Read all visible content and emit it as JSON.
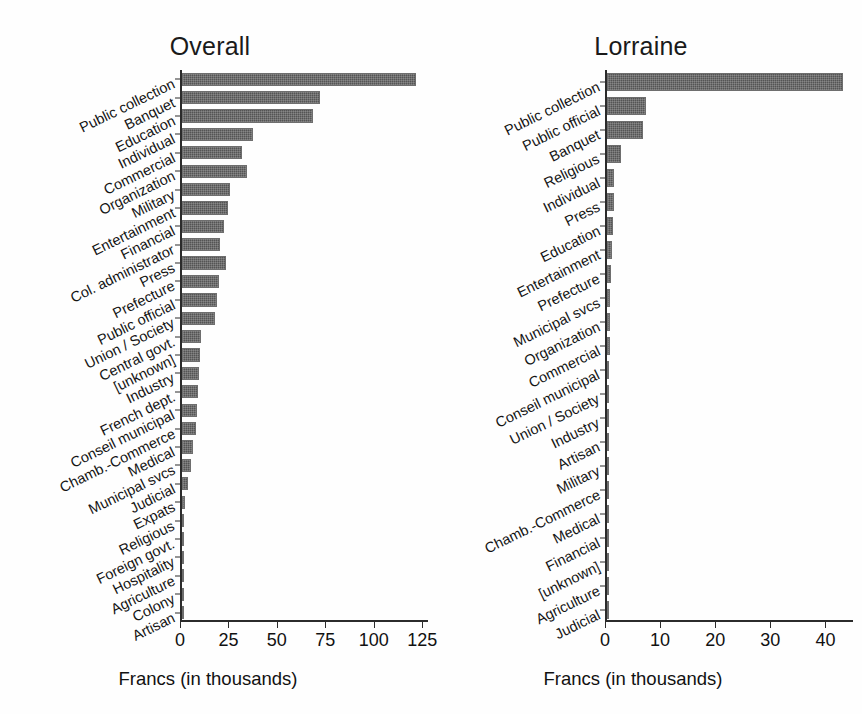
{
  "figure": {
    "background": "#fefefe",
    "bar_color": "#545454",
    "axis_color": "#2b2b2b"
  },
  "chart_data": [
    {
      "type": "bar",
      "orientation": "horizontal",
      "title": "Overall",
      "xlabel": "Francs (in thousands)",
      "ylabel": "",
      "xlim": [
        0,
        128
      ],
      "xticks": [
        0,
        25,
        50,
        75,
        100,
        125
      ],
      "xticklabels": [
        "0",
        "25",
        "50",
        "75",
        "100",
        "125"
      ],
      "grid": false,
      "legend": "none",
      "categories": [
        "Public collection",
        "Banquet",
        "Education",
        "Individual",
        "Commercial",
        "Organization",
        "Military",
        "Entertainment",
        "Financial",
        "Col. administrator",
        "Press",
        "Prefecture",
        "Public official",
        "Union / Society",
        "Central govt.",
        "[unknown]",
        "Industry",
        "French dept.",
        "Conseil municipal",
        "Chamb.-Commerce",
        "Medical",
        "Municipal svcs",
        "Judicial",
        "Expats",
        "Religious",
        "Foreign govt.",
        "Hospitality",
        "Agriculture",
        "Colony",
        "Artisan"
      ],
      "values": [
        122,
        72,
        68,
        37,
        31,
        34,
        25,
        24,
        22,
        20,
        23,
        19,
        18,
        17,
        10,
        9.5,
        9,
        8.5,
        8,
        7.5,
        5.5,
        4.5,
        3,
        1.5,
        1.2,
        0.8,
        0.5,
        0.4,
        0.3,
        0.2
      ]
    },
    {
      "type": "bar",
      "orientation": "horizontal",
      "title": "Lorraine",
      "xlabel": "Francs (in thousands)",
      "ylabel": "",
      "xlim": [
        0,
        45
      ],
      "xticks": [
        0,
        10,
        20,
        30,
        40
      ],
      "xticklabels": [
        "0",
        "10",
        "20",
        "30",
        "40"
      ],
      "grid": false,
      "legend": "none",
      "categories": [
        "Public collection",
        "Public official",
        "Banquet",
        "Religious",
        "Individual",
        "Press",
        "Education",
        "Entertainment",
        "Prefecture",
        "Municipal svcs",
        "Organization",
        "Commercial",
        "Conseil municipal",
        "Union / Society",
        "Industry",
        "Artisan",
        "Military",
        "Chamb.-Commerce",
        "Medical",
        "Financial",
        "[unknown]",
        "Agriculture",
        "Judicial"
      ],
      "values": [
        43.2,
        7.2,
        6.6,
        2.5,
        1.3,
        1.2,
        1.1,
        0.9,
        0.7,
        0.6,
        0.55,
        0.5,
        0.45,
        0.4,
        0.35,
        0.3,
        0.22,
        0.18,
        0.15,
        0.12,
        0.1,
        0.07,
        0.05
      ]
    }
  ]
}
